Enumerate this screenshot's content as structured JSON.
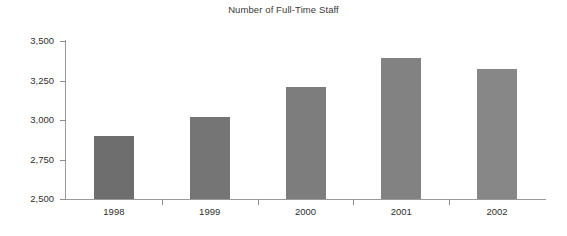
{
  "chart_data": {
    "type": "bar",
    "title": "Number of Full-Time Staff",
    "xlabel": "",
    "ylabel": "",
    "categories": [
      "1998",
      "1999",
      "2000",
      "2001",
      "2002"
    ],
    "values": [
      2900,
      3020,
      3210,
      3390,
      3320
    ],
    "ylim": [
      2500,
      3500
    ],
    "yticks": [
      2500,
      2750,
      3000,
      3250,
      3500
    ],
    "ytick_labels": [
      "2,500",
      "2,750",
      "3,000",
      "3,250",
      "3,500"
    ],
    "grid": false,
    "legend": null,
    "series": [
      {
        "name": "Full-Time Staff",
        "values": [
          2900,
          3020,
          3210,
          3390,
          3320
        ],
        "colors": [
          "#6e6e6e",
          "#757575",
          "#7d7d7d",
          "#828282",
          "#878787"
        ]
      }
    ],
    "bar_colors": [
      "#6e6e6e",
      "#757575",
      "#7d7d7d",
      "#828282",
      "#878787"
    ],
    "axis_color": "#9a9a9a",
    "text_color": "#2f2f2f",
    "background": "#ffffff"
  }
}
